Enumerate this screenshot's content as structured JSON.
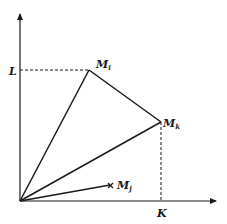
{
  "diagram": {
    "axes": {
      "x_label": "K",
      "y_label": "L",
      "origin": [
        20,
        201
      ],
      "x_end": [
        217,
        201
      ],
      "y_end": [
        20,
        13
      ]
    },
    "points": [
      {
        "id": "Mi",
        "label": "M",
        "sub": "i",
        "x": 89,
        "y": 70,
        "marker": "vertex"
      },
      {
        "id": "Mk",
        "label": "M",
        "sub": "k",
        "x": 161,
        "y": 122,
        "marker": "vertex"
      },
      {
        "id": "Mj",
        "label": "M",
        "sub": "j",
        "x": 111,
        "y": 185,
        "marker": "cross"
      }
    ],
    "segments": [
      {
        "from": "origin",
        "to": "Mi",
        "style": "solid"
      },
      {
        "from": "origin",
        "to": "Mk",
        "style": "solid"
      },
      {
        "from": "Mi",
        "to": "Mk",
        "style": "solid"
      },
      {
        "from": "origin",
        "to": "Mj",
        "style": "solid"
      }
    ],
    "guides": [
      {
        "from": [
          20,
          70
        ],
        "to": [
          89,
          70
        ],
        "style": "dashed",
        "name": "L-guide"
      },
      {
        "from": [
          161,
          122
        ],
        "to": [
          161,
          201
        ],
        "style": "dashed",
        "name": "K-guide"
      }
    ],
    "colors": {
      "ink": "#1a1a1a",
      "background": "#ffffff"
    }
  }
}
